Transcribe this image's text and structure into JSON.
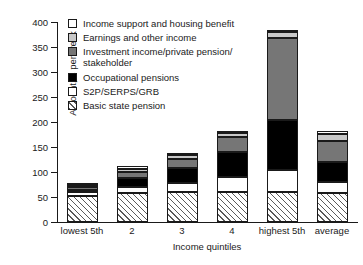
{
  "chart_data": {
    "type": "bar",
    "subtype": "stacked-bar",
    "title": "",
    "xlabel": "Income quintiles",
    "ylabel": "Amount, £ per week",
    "ylim": [
      0,
      400
    ],
    "yticks": [
      0,
      50,
      100,
      150,
      200,
      250,
      300,
      350,
      400
    ],
    "grid": false,
    "legend_position": "upper-left-inside",
    "categories": [
      "lowest 5th",
      "2",
      "3",
      "4",
      "highest 5th",
      "average"
    ],
    "series": [
      {
        "name": "Basic state pension",
        "key": "basic",
        "swatch": "hatched",
        "color": "#ffffff",
        "values": [
          52,
          58,
          60,
          60,
          60,
          58
        ]
      },
      {
        "name": "S2P/SERPS/GRB",
        "key": "s2p",
        "swatch": "white",
        "color": "#ffffff",
        "values": [
          8,
          12,
          18,
          30,
          44,
          22
        ]
      },
      {
        "name": "Occupational pensions",
        "key": "occupational",
        "swatch": "black",
        "color": "#000000",
        "values": [
          4,
          18,
          30,
          50,
          100,
          40
        ]
      },
      {
        "name": "Investment income/private pension/\nstakeholder",
        "key": "investment",
        "swatch": "dark-grey",
        "color": "#767676",
        "values": [
          7,
          13,
          18,
          30,
          164,
          42
        ]
      },
      {
        "name": "Earnings and other income",
        "key": "earnings",
        "swatch": "light-grey",
        "color": "#c8c8c8",
        "values": [
          3,
          6,
          8,
          8,
          12,
          14
        ]
      },
      {
        "name": "Income support and housing benefit",
        "key": "support",
        "swatch": "white",
        "color": "#ffffff",
        "values": [
          4,
          5,
          4,
          4,
          4,
          6
        ]
      }
    ],
    "totals": [
      78,
      112,
      138,
      182,
      384,
      182
    ]
  },
  "axes": {
    "y_title": "Amount, £ per week",
    "x_title": "Income quintiles",
    "y_tick_labels": [
      "400",
      "350",
      "300",
      "250",
      "200",
      "150",
      "100",
      "50",
      "0"
    ],
    "x_tick_labels": [
      "lowest 5th",
      "2",
      "3",
      "4",
      "highest 5th",
      "average"
    ]
  },
  "legend": {
    "items": [
      {
        "label": "Income support and housing benefit",
        "swatch": "white"
      },
      {
        "label": "Earnings and other income",
        "swatch": "light-grey"
      },
      {
        "label": "Investment income/private pension/\nstakeholder",
        "swatch": "dark-grey"
      },
      {
        "label": "Occupational pensions",
        "swatch": "black"
      },
      {
        "label": "S2P/SERPS/GRB",
        "swatch": "white"
      },
      {
        "label": "Basic state pension",
        "swatch": "hatched"
      }
    ]
  },
  "colors": {
    "axis": "#1a1a1a",
    "earnings": "#c8c8c8",
    "investment": "#767676",
    "occupational": "#000000",
    "background": "#ffffff"
  }
}
